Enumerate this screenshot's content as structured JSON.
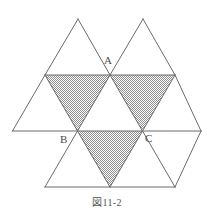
{
  "figure": {
    "caption": "図11-2",
    "labels": [
      {
        "id": "A",
        "text": "A"
      },
      {
        "id": "B",
        "text": "B"
      },
      {
        "id": "C",
        "text": "C"
      }
    ],
    "colors": {
      "background": "#ffffff",
      "stroke": "#6b6b6b",
      "shading": "#a9a9a9",
      "label_text": "#4a4a4a",
      "caption_text": "#555555"
    },
    "geometry": {
      "description": "Triangular lattice of equilateral triangles; three shaded downward-pointing triangles form a larger inverted triangle with vertices A, B, C at the midpoints of its sides",
      "triangle_side": 65,
      "triangle_height": 56,
      "rows_y": [
        19,
        75,
        131,
        187
      ],
      "shaded_triangles": [
        {
          "name": "upper-left-shaded",
          "points": "45,75 110,75 77.5,131"
        },
        {
          "name": "upper-right-shaded",
          "points": "110,75 175,75 142.5,131"
        },
        {
          "name": "lower-middle-shaded",
          "points": "77.5,131 142.5,131 110,187"
        }
      ],
      "outline_triangles": [
        {
          "name": "top-left-triangle",
          "points": "78,19 110,75 45,75"
        },
        {
          "name": "top-right-triangle",
          "points": "143,19 175,75 110,75"
        },
        {
          "name": "left-triangle",
          "points": "45,75 77.5,131 12.5,131"
        },
        {
          "name": "middle-triangle",
          "points": "110,75 142.5,131 77.5,131"
        },
        {
          "name": "right-triangle",
          "points": "175,75 201,131 142.5,131"
        },
        {
          "name": "bottom-left-triangle",
          "points": "77.5,131 110,187 45,187"
        },
        {
          "name": "bottom-right-triangle",
          "points": "142.5,131 175,187 110,187"
        }
      ]
    }
  }
}
